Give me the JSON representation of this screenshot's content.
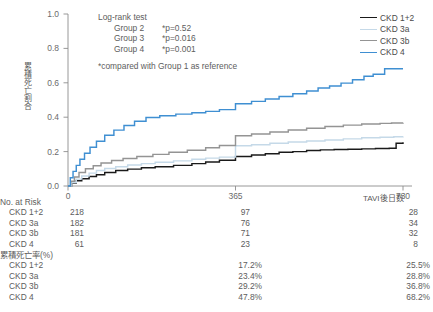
{
  "chart_data": {
    "type": "line",
    "title": "",
    "xlabel": "TAVI後日数",
    "ylabel": "累積死亡割合",
    "xlim": [
      0,
      760
    ],
    "ylim": [
      0,
      1.0
    ],
    "xticks": [
      0,
      365,
      730
    ],
    "xtick_labels": [
      "0",
      "365",
      "730"
    ],
    "yticks": [
      0.0,
      0.2,
      0.4,
      0.6,
      0.8,
      1.0
    ],
    "ytick_labels": [
      "0.0",
      "0.2",
      "0.4",
      "0.6",
      "0.8",
      "1.0"
    ],
    "grid": false,
    "legend_position": "top-right",
    "series": [
      {
        "name": "CKD 1+2",
        "color": "#1a1a1a",
        "x": [
          0,
          8,
          18,
          30,
          46,
          62,
          80,
          104,
          130,
          160,
          190,
          230,
          270,
          300,
          330,
          365,
          400,
          430,
          460,
          490,
          520,
          550,
          580,
          610,
          640,
          670,
          700,
          715,
          730
        ],
        "y": [
          0.0,
          0.018,
          0.03,
          0.042,
          0.055,
          0.066,
          0.078,
          0.09,
          0.098,
          0.106,
          0.112,
          0.12,
          0.13,
          0.14,
          0.15,
          0.172,
          0.18,
          0.188,
          0.196,
          0.2,
          0.206,
          0.21,
          0.212,
          0.214,
          0.216,
          0.218,
          0.22,
          0.248,
          0.255
        ]
      },
      {
        "name": "CKD 3a",
        "color": "#c5d9e8",
        "x": [
          0,
          8,
          18,
          30,
          46,
          62,
          80,
          104,
          130,
          160,
          190,
          230,
          270,
          300,
          330,
          365,
          400,
          440,
          480,
          520,
          560,
          600,
          640,
          680,
          710,
          730
        ],
        "y": [
          0.0,
          0.02,
          0.04,
          0.058,
          0.075,
          0.09,
          0.102,
          0.112,
          0.122,
          0.13,
          0.138,
          0.146,
          0.155,
          0.162,
          0.168,
          0.234,
          0.24,
          0.248,
          0.256,
          0.262,
          0.268,
          0.274,
          0.28,
          0.284,
          0.286,
          0.288
        ]
      },
      {
        "name": "CKD 3b",
        "color": "#949494",
        "x": [
          0,
          6,
          14,
          24,
          38,
          55,
          72,
          95,
          120,
          150,
          185,
          220,
          260,
          300,
          330,
          365,
          400,
          440,
          480,
          520,
          560,
          600,
          640,
          680,
          705,
          730
        ],
        "y": [
          0.0,
          0.028,
          0.052,
          0.078,
          0.1,
          0.118,
          0.134,
          0.148,
          0.16,
          0.172,
          0.184,
          0.196,
          0.208,
          0.222,
          0.236,
          0.292,
          0.302,
          0.314,
          0.326,
          0.336,
          0.346,
          0.354,
          0.36,
          0.364,
          0.366,
          0.368
        ]
      },
      {
        "name": "CKD 4",
        "color": "#3f8fd2",
        "x": [
          0,
          5,
          11,
          18,
          26,
          36,
          48,
          62,
          80,
          100,
          122,
          145,
          170,
          200,
          235,
          270,
          300,
          330,
          365,
          400,
          430,
          460,
          490,
          520,
          545,
          570,
          595,
          620,
          645,
          665,
          690,
          730
        ],
        "y": [
          0.0,
          0.048,
          0.085,
          0.12,
          0.155,
          0.19,
          0.225,
          0.26,
          0.295,
          0.325,
          0.352,
          0.376,
          0.398,
          0.408,
          0.418,
          0.426,
          0.434,
          0.444,
          0.478,
          0.492,
          0.506,
          0.52,
          0.536,
          0.552,
          0.57,
          0.582,
          0.598,
          0.618,
          0.638,
          0.65,
          0.682,
          0.682
        ]
      }
    ],
    "annotations": {
      "test_title": "Log-rank test",
      "rows": [
        {
          "group": "Group 2",
          "p": "*p=0.52"
        },
        {
          "group": "Group 3",
          "p": "*p=0.016"
        },
        {
          "group": "Group 4",
          "p": "*p=0.001"
        }
      ],
      "footnote": "*compared with Group 1 as reference"
    }
  },
  "legend": {
    "items": [
      {
        "label": "CKD 1+2",
        "color": "#1a1a1a"
      },
      {
        "label": "CKD 3a",
        "color": "#c5d9e8"
      },
      {
        "label": "CKD 3b",
        "color": "#949494"
      },
      {
        "label": "CKD 4",
        "color": "#3f8fd2"
      }
    ]
  },
  "risk_table": {
    "header": "No. at Risk",
    "rows": [
      {
        "name": "CKD 1+2",
        "v0": "218",
        "v1": "97",
        "v2": "28"
      },
      {
        "name": "CKD 3a",
        "v0": "182",
        "v1": "76",
        "v2": "34"
      },
      {
        "name": "CKD 3b",
        "v0": "181",
        "v1": "71",
        "v2": "32"
      },
      {
        "name": "CKD 4",
        "v0": "61",
        "v1": "23",
        "v2": "8"
      }
    ]
  },
  "mortality_table": {
    "header": "累積死亡率(%)",
    "rows": [
      {
        "name": "CKD 1+2",
        "v1": "17.2%",
        "v2": "25.5%"
      },
      {
        "name": "CKD 3a",
        "v1": "23.4%",
        "v2": "28.8%"
      },
      {
        "name": "CKD 3b",
        "v1": "29.2%",
        "v2": "36.8%"
      },
      {
        "name": "CKD 4",
        "v1": "47.8%",
        "v2": "68.2%"
      }
    ]
  },
  "axes": {
    "ylabel": "累積死亡割合",
    "xlabel": "TAVI後日数",
    "ytick_labels": [
      "1.0",
      "0.8",
      "0.6",
      "0.4",
      "0.2",
      "0.0"
    ],
    "xtick_labels": [
      "0",
      "365",
      "730"
    ]
  }
}
